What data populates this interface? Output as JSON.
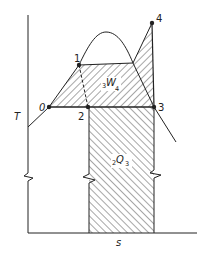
{
  "diagram": {
    "type": "T-s diagram (Rankine-type cycle)",
    "axes": {
      "y_label": "T",
      "x_label": "s"
    },
    "points": [
      {
        "id": "0",
        "label": "0"
      },
      {
        "id": "1",
        "label": "1"
      },
      {
        "id": "2",
        "label": "2"
      },
      {
        "id": "3",
        "label": "3"
      },
      {
        "id": "4",
        "label": "4"
      }
    ],
    "areas": {
      "work": {
        "prefix": "3",
        "symbol": "W",
        "suffix": "4"
      },
      "heat": {
        "prefix": "2",
        "symbol": "Q",
        "suffix": "3"
      }
    },
    "colors": {
      "line": "#222222",
      "background": "#ffffff"
    }
  }
}
